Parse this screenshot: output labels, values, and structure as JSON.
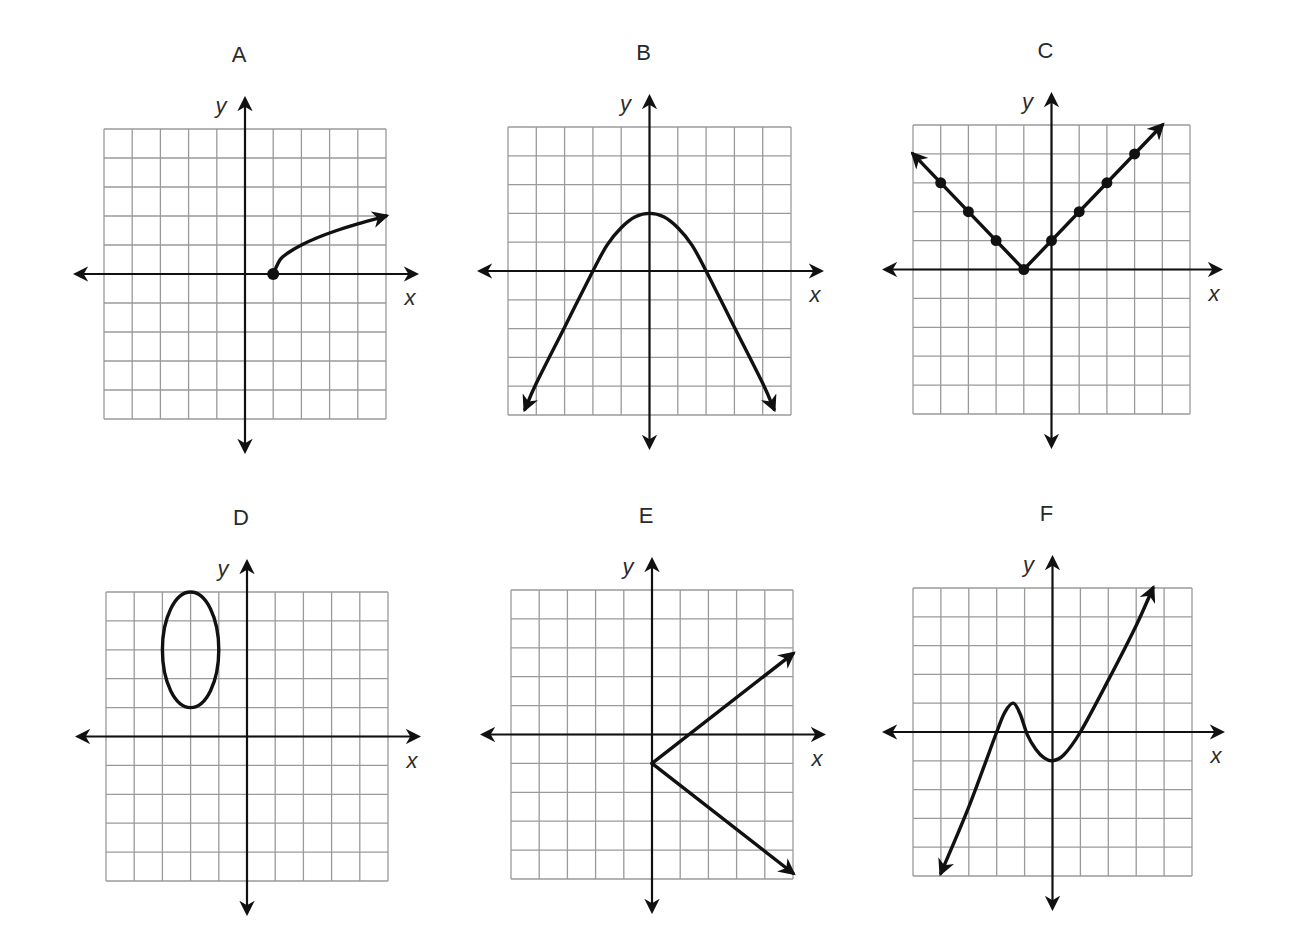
{
  "page": {
    "width": 1294,
    "height": 935,
    "colors": {
      "background": "#ffffff",
      "grid": "#9a9a9a",
      "ink": "#111111",
      "text": "#2a2a2a"
    }
  },
  "chart_data": [
    {
      "type": "line",
      "title": "A",
      "xlabel": "x",
      "ylabel": "y",
      "grid": true,
      "xlim": [
        -5,
        5
      ],
      "ylim": [
        -5,
        5
      ],
      "box": {
        "left": 104,
        "top": 129,
        "right": 386,
        "bottom": 419
      },
      "description": "square-root curve starting at closed point (1,0), arrow toward (5,2)",
      "shapes": [
        {
          "kind": "path",
          "points": [
            [
              1,
              0
            ],
            [
              1.25,
              0.5
            ],
            [
              1.56,
              0.75
            ],
            [
              2,
              1
            ],
            [
              2.56,
              1.25
            ],
            [
              3.25,
              1.5
            ],
            [
              4,
              1.73
            ],
            [
              5,
              2
            ]
          ],
          "arrow_end": true,
          "arrow_start": false
        },
        {
          "kind": "dot",
          "at": [
            1,
            0
          ]
        }
      ]
    },
    {
      "type": "line",
      "title": "B",
      "xlabel": "x",
      "ylabel": "y",
      "grid": true,
      "xlim": [
        -5,
        5
      ],
      "ylim": [
        -5,
        5
      ],
      "box": {
        "left": 508,
        "top": 127,
        "right": 791,
        "bottom": 415
      },
      "description": "downward parabola, vertex (0,2), x-intercepts -2 and 2, arrows at both ends",
      "shapes": [
        {
          "kind": "path",
          "points": [
            [
              -4.4,
              -4.8
            ],
            [
              -4,
              -3.9
            ],
            [
              -3,
              -1.95
            ],
            [
              -2,
              0
            ],
            [
              -1.5,
              0.9
            ],
            [
              -1,
              1.5
            ],
            [
              -0.5,
              1.88
            ],
            [
              0,
              2
            ],
            [
              0.5,
              1.88
            ],
            [
              1,
              1.5
            ],
            [
              1.5,
              0.9
            ],
            [
              2,
              0
            ],
            [
              3,
              -1.95
            ],
            [
              4,
              -3.9
            ],
            [
              4.4,
              -4.8
            ]
          ],
          "arrow_end": true,
          "arrow_start": true
        }
      ]
    },
    {
      "type": "line",
      "title": "C",
      "xlabel": "x",
      "ylabel": "y",
      "grid": true,
      "xlim": [
        -5,
        5
      ],
      "ylim": [
        -5,
        5
      ],
      "box": {
        "left": 913,
        "top": 125,
        "right": 1190,
        "bottom": 414
      },
      "description": "absolute value graph y=|x+1|, vertex (-1,0), dotted integer points, arrows at both ends",
      "shapes": [
        {
          "kind": "path",
          "points": [
            [
              -5,
              4
            ],
            [
              -1,
              0
            ],
            [
              4,
              5
            ]
          ],
          "arrow_end": true,
          "arrow_start": true
        },
        {
          "kind": "dots",
          "points": [
            [
              -4,
              3
            ],
            [
              -3,
              2
            ],
            [
              -2,
              1
            ],
            [
              -1,
              0
            ],
            [
              0,
              1
            ],
            [
              1,
              2
            ],
            [
              2,
              3
            ],
            [
              3,
              4
            ]
          ]
        }
      ]
    },
    {
      "type": "line",
      "title": "D",
      "xlabel": "x",
      "ylabel": "y",
      "grid": true,
      "xlim": [
        -5,
        5
      ],
      "ylim": [
        -5,
        5
      ],
      "box": {
        "left": 106,
        "top": 592,
        "right": 388,
        "bottom": 881
      },
      "description": "vertical ellipse centered at (-2,3), horizontal radius 1, vertical radius 2",
      "shapes": [
        {
          "kind": "ellipse",
          "center": [
            -2,
            3
          ],
          "rx": 1,
          "ry": 2
        }
      ]
    },
    {
      "type": "line",
      "title": "E",
      "xlabel": "x",
      "ylabel": "y",
      "grid": true,
      "xlim": [
        -5,
        5
      ],
      "ylim": [
        -5,
        5
      ],
      "box": {
        "left": 511,
        "top": 590,
        "right": 793,
        "bottom": 879
      },
      "description": "sideways V opening right, vertex (0,-1), rays toward (5,3) and (5,-5)",
      "shapes": [
        {
          "kind": "path",
          "points": [
            [
              0,
              -1
            ],
            [
              5,
              2.8
            ]
          ],
          "arrow_end": true,
          "arrow_start": false
        },
        {
          "kind": "path",
          "points": [
            [
              0,
              -1
            ],
            [
              5,
              -4.8
            ]
          ],
          "arrow_end": true,
          "arrow_start": false
        }
      ]
    },
    {
      "type": "line",
      "title": "F",
      "xlabel": "x",
      "ylabel": "y",
      "grid": true,
      "xlim": [
        -5,
        5
      ],
      "ylim": [
        -5,
        5
      ],
      "box": {
        "left": 913,
        "top": 588,
        "right": 1192,
        "bottom": 876
      },
      "description": "cubic-like curve: arrow at (-4,-5), crosses x=-2, local max near (-1.4,1), local min (0,-1), crosses x=1, arrow toward (3.6,5)",
      "shapes": [
        {
          "kind": "path",
          "points": [
            [
              -4,
              -4.9
            ],
            [
              -3,
              -2.6
            ],
            [
              -2,
              0
            ],
            [
              -1.7,
              0.7
            ],
            [
              -1.4,
              1
            ],
            [
              -1.15,
              0.6
            ],
            [
              -0.9,
              -0.1
            ],
            [
              -0.6,
              -0.6
            ],
            [
              -0.3,
              -0.9
            ],
            [
              0,
              -1
            ],
            [
              0.4,
              -0.8
            ],
            [
              1,
              0
            ],
            [
              2,
              1.8
            ],
            [
              3,
              3.7
            ],
            [
              3.6,
              5
            ]
          ],
          "arrow_end": true,
          "arrow_start": true
        }
      ]
    }
  ]
}
